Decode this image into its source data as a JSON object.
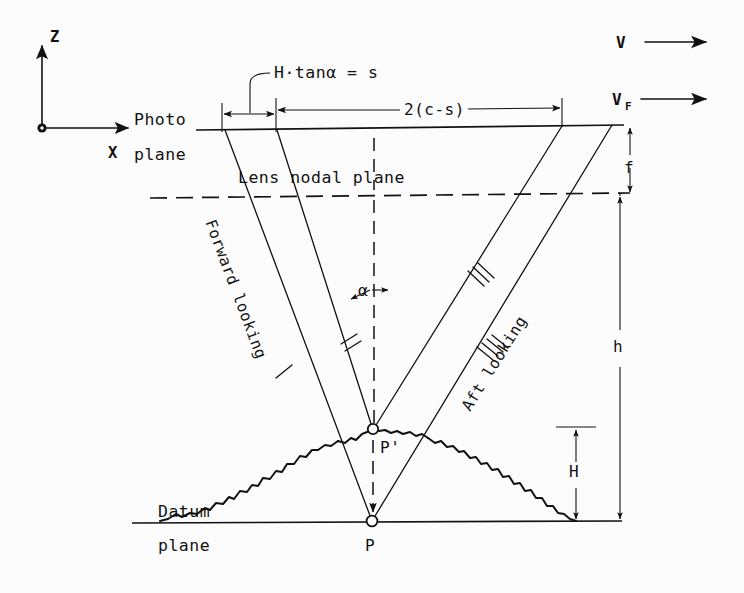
{
  "figure": {
    "type": "technical-diagram",
    "background_color": "#fcfcfc",
    "ink_color": "#111111"
  },
  "axes": {
    "origin_label": "origin-dot",
    "vertical_label": "Z",
    "horizontal_label": "X"
  },
  "velocity": {
    "aircraft_label": "V",
    "film_label": "V",
    "film_subscript": "F"
  },
  "planes": {
    "photo_line1": "Photo",
    "photo_line2": "plane",
    "nodal": "Lens nodal plane",
    "datum_line1": "Datum",
    "datum_line2": "plane"
  },
  "dimensions": {
    "s_expression": "H·tanα = s",
    "baseline": "2(c-s)",
    "focal_length": "f",
    "flying_height": "h",
    "terrain_height": "H",
    "angle": "α"
  },
  "rays": {
    "forward_label": "Forward looking",
    "aft_label": "Aft looking",
    "tick_marks": {
      "forward_outer": 1,
      "forward_inner": 2,
      "aft_inner": 3,
      "aft_outer": 4
    }
  },
  "points": {
    "ground_point": "P",
    "displaced_point": "P'"
  }
}
